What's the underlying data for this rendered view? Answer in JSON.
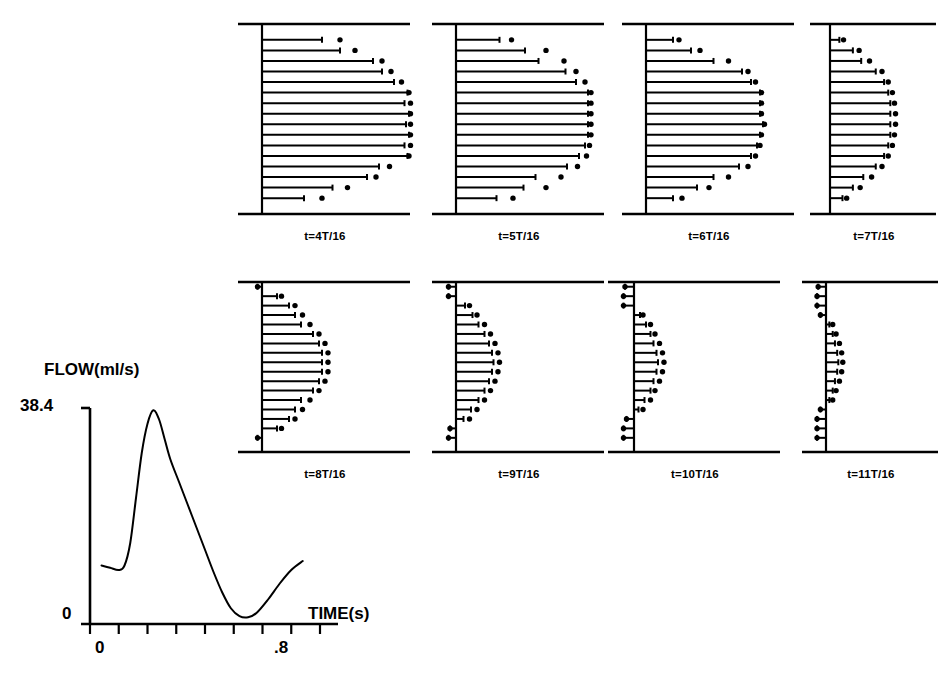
{
  "figure": {
    "kind": "velocity-profile-panels-with-flow-waveform"
  },
  "waveform": {
    "ylabel": "FLOW(ml/s)",
    "xlabel": "TIME(s)",
    "y_max_label": "38.4",
    "y_min_label": "0",
    "x_start_label": "0",
    "x_end_label": ".8"
  },
  "panels": [
    {
      "label": "t=4T/16"
    },
    {
      "label": "t=5T/16"
    },
    {
      "label": "t=6T/16"
    },
    {
      "label": "t=7T/16"
    },
    {
      "label": "t=8T/16"
    },
    {
      "label": "t=9T/16"
    },
    {
      "label": "t=10T/16"
    },
    {
      "label": "t=11T/16"
    }
  ],
  "chart_data": {
    "type": "line",
    "title": "",
    "xlabel": "TIME(s)",
    "ylabel": "FLOW(ml/s)",
    "xlim": [
      0,
      0.8
    ],
    "ylim": [
      0,
      38.4
    ],
    "ytick_labels": [
      "0",
      "38.4"
    ],
    "xtick_labels": [
      "0",
      ".8"
    ],
    "xticks": [
      0,
      0.1,
      0.2,
      0.3,
      0.4,
      0.5,
      0.6,
      0.7,
      0.8
    ],
    "grid": false,
    "legend": null,
    "series": [
      {
        "name": "Aortic flow waveform",
        "x": [
          0.04,
          0.07,
          0.1,
          0.12,
          0.14,
          0.16,
          0.18,
          0.2,
          0.22,
          0.24,
          0.26,
          0.28,
          0.31,
          0.34,
          0.37,
          0.4,
          0.43,
          0.46,
          0.49,
          0.52,
          0.55,
          0.58,
          0.62,
          0.66,
          0.7,
          0.74
        ],
        "y": [
          10.4,
          10.0,
          9.6,
          10.4,
          14.4,
          22.4,
          30.4,
          35.6,
          38.0,
          36.4,
          32.8,
          29.2,
          25.2,
          21.2,
          17.2,
          13.2,
          9.2,
          5.6,
          2.8,
          1.4,
          1.2,
          2.0,
          4.4,
          7.2,
          9.6,
          11.2
        ]
      }
    ]
  },
  "profile_data": {
    "type": "line",
    "description": "Axial velocity profiles across a tube diameter at eight phases of the cardiac cycle. Each panel plots, for 16 radial stations, a horizontal velocity vector (solid line) from the tube centre-axis and a measured data point (filled diamond). Values are normalised profile half-widths, 1.0 = widest vector drawn in panel 1.",
    "radial_stations": 16,
    "panels": [
      {
        "label": "t=4T/16",
        "line_values": [
          0.0,
          0.4,
          0.52,
          0.74,
          0.8,
          0.88,
          0.97,
          0.95,
          0.98,
          0.96,
          0.98,
          0.95,
          0.97,
          0.78,
          0.7,
          0.47,
          0.28,
          0.0
        ],
        "point_values": [
          0.0,
          0.52,
          0.62,
          0.8,
          0.86,
          0.93,
          0.98,
          0.99,
          0.99,
          0.99,
          0.99,
          0.99,
          0.98,
          0.85,
          0.76,
          0.57,
          0.4,
          0.0
        ]
      },
      {
        "label": "t=5T/16",
        "line_values": [
          0.0,
          0.29,
          0.46,
          0.55,
          0.73,
          0.8,
          0.88,
          0.88,
          0.88,
          0.88,
          0.88,
          0.86,
          0.82,
          0.74,
          0.53,
          0.45,
          0.27,
          0.0
        ],
        "point_values": [
          0.0,
          0.37,
          0.6,
          0.72,
          0.8,
          0.86,
          0.9,
          0.9,
          0.9,
          0.9,
          0.9,
          0.89,
          0.87,
          0.81,
          0.7,
          0.6,
          0.38,
          0.0
        ]
      },
      {
        "label": "t=6T/16",
        "line_values": [
          0.0,
          0.18,
          0.3,
          0.45,
          0.64,
          0.7,
          0.76,
          0.76,
          0.76,
          0.78,
          0.76,
          0.74,
          0.7,
          0.62,
          0.45,
          0.34,
          0.18,
          0.0
        ],
        "point_values": [
          0.0,
          0.22,
          0.36,
          0.55,
          0.68,
          0.73,
          0.77,
          0.77,
          0.77,
          0.79,
          0.77,
          0.76,
          0.73,
          0.68,
          0.55,
          0.42,
          0.24,
          0.0
        ]
      },
      {
        "label": "t=7T/16",
        "line_values": [
          0.0,
          0.09,
          0.22,
          0.3,
          0.44,
          0.52,
          0.56,
          0.58,
          0.58,
          0.58,
          0.58,
          0.56,
          0.52,
          0.44,
          0.32,
          0.22,
          0.12,
          0.0
        ],
        "point_values": [
          0.0,
          0.13,
          0.28,
          0.38,
          0.5,
          0.56,
          0.6,
          0.62,
          0.63,
          0.63,
          0.62,
          0.6,
          0.56,
          0.5,
          0.4,
          0.29,
          0.16,
          0.0
        ]
      },
      {
        "label": "t=8T/16",
        "line_values": [
          -0.03,
          0.1,
          0.18,
          0.22,
          0.26,
          0.34,
          0.38,
          0.4,
          0.4,
          0.4,
          0.38,
          0.34,
          0.26,
          0.22,
          0.18,
          0.1,
          -0.03,
          0.0
        ],
        "point_values": [
          -0.03,
          0.13,
          0.22,
          0.27,
          0.32,
          0.38,
          0.42,
          0.44,
          0.44,
          0.44,
          0.42,
          0.38,
          0.32,
          0.27,
          0.22,
          0.13,
          -0.03,
          0.0
        ]
      },
      {
        "label": "t=9T/16",
        "line_values": [
          -0.05,
          -0.05,
          0.06,
          0.11,
          0.15,
          0.19,
          0.22,
          0.24,
          0.25,
          0.24,
          0.22,
          0.19,
          0.15,
          0.1,
          0.05,
          -0.04,
          -0.05,
          0.0
        ],
        "point_values": [
          -0.05,
          -0.05,
          0.09,
          0.14,
          0.19,
          0.23,
          0.26,
          0.28,
          0.29,
          0.28,
          0.26,
          0.23,
          0.19,
          0.14,
          0.09,
          -0.04,
          -0.05,
          0.0
        ]
      },
      {
        "label": "t=10T/16",
        "line_values": [
          -0.06,
          -0.07,
          -0.07,
          0.04,
          0.08,
          0.11,
          0.13,
          0.15,
          0.16,
          0.15,
          0.13,
          0.11,
          0.07,
          0.03,
          -0.05,
          -0.07,
          -0.07,
          0.0
        ],
        "point_values": [
          -0.06,
          -0.07,
          -0.07,
          0.06,
          0.11,
          0.14,
          0.17,
          0.19,
          0.2,
          0.19,
          0.17,
          0.14,
          0.11,
          0.06,
          -0.05,
          -0.07,
          -0.07,
          0.0
        ]
      },
      {
        "label": "t=11T/16",
        "line_values": [
          -0.07,
          -0.08,
          -0.08,
          -0.05,
          0.03,
          0.06,
          0.08,
          0.1,
          0.11,
          0.1,
          0.08,
          0.06,
          0.03,
          -0.05,
          -0.08,
          -0.08,
          -0.08,
          0.0
        ],
        "point_values": [
          -0.07,
          -0.08,
          -0.08,
          -0.05,
          0.06,
          0.09,
          0.12,
          0.14,
          0.15,
          0.14,
          0.12,
          0.09,
          0.06,
          -0.05,
          -0.08,
          -0.08,
          -0.08,
          0.0
        ]
      }
    ]
  }
}
